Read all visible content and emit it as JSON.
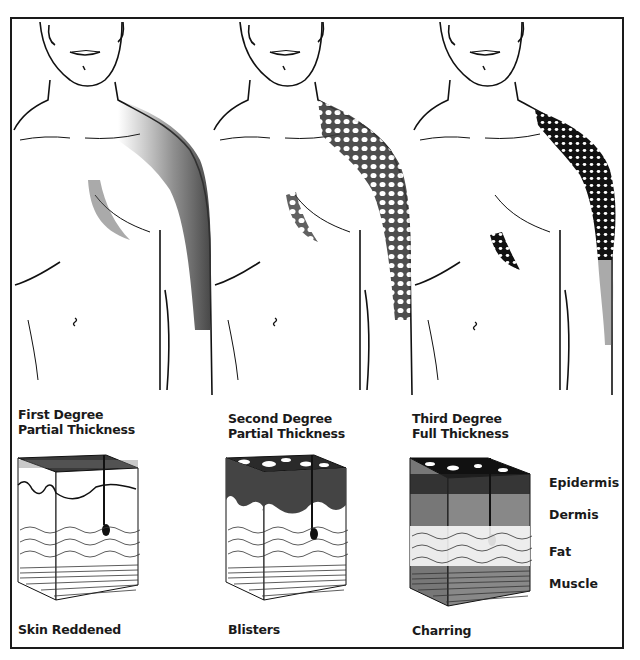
{
  "figure": {
    "columns": [
      {
        "title_line1": "First Degree",
        "title_line2": "Partial Thickness",
        "caption": "Skin Reddened"
      },
      {
        "title_line1": "Second Degree",
        "title_line2": "Partial Thickness",
        "caption": "Blisters"
      },
      {
        "title_line1": "Third Degree",
        "title_line2": "Full Thickness",
        "caption": "Charring"
      }
    ],
    "layer_labels": [
      "Epidermis",
      "Dermis",
      "Fat",
      "Muscle"
    ]
  },
  "colors": {
    "ink": "#1a1a1a",
    "background": "#ffffff",
    "burn_light": "#6a6a6a",
    "burn_dark": "#2a2a2a"
  }
}
